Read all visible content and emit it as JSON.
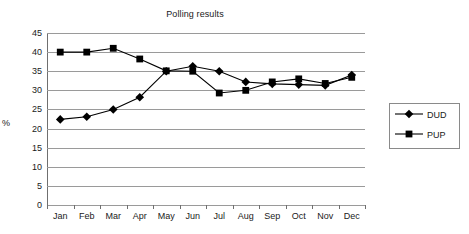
{
  "chart_data": {
    "type": "line",
    "title": "Polling results",
    "xlabel": "",
    "ylabel": "%",
    "categories": [
      "Jan",
      "Feb",
      "Mar",
      "Apr",
      "May",
      "Jun",
      "Jul",
      "Aug",
      "Sep",
      "Oct",
      "Nov",
      "Dec"
    ],
    "ylim": [
      0,
      45
    ],
    "ytick_step": 5,
    "yticks": [
      45,
      40,
      35,
      30,
      25,
      20,
      15,
      10,
      5,
      0
    ],
    "grid": "horizontal",
    "legend_position": "right",
    "series": [
      {
        "name": "DUD",
        "marker": "diamond",
        "color": "#000000",
        "values": [
          22.4,
          23.1,
          25.0,
          28.2,
          35.0,
          36.3,
          35.0,
          32.2,
          31.7,
          31.5,
          31.3,
          34.0
        ]
      },
      {
        "name": "PUP",
        "marker": "square",
        "color": "#000000",
        "values": [
          40.0,
          40.0,
          41.0,
          38.2,
          35.1,
          35.0,
          29.3,
          30.0,
          32.2,
          33.0,
          31.8,
          33.4
        ]
      }
    ]
  },
  "chart": {
    "title": "Polling results",
    "y_axis_title": "%",
    "cropped_header_text": "",
    "legend": {
      "items": [
        {
          "label": "DUD",
          "marker": "diamond"
        },
        {
          "label": "PUP",
          "marker": "square"
        }
      ]
    }
  }
}
